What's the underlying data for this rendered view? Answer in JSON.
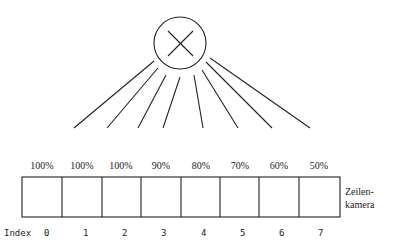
{
  "diagram": {
    "node": {
      "symbol": "multiply"
    },
    "weights": [
      "100%",
      "100%",
      "100%",
      "90%",
      "80%",
      "70%",
      "60%",
      "50%"
    ],
    "camera_label_line1": "Zeilen-",
    "camera_label_line2": "kamera",
    "index_label": "Index",
    "indices": [
      "0",
      "1",
      "2",
      "3",
      "4",
      "5",
      "6",
      "7"
    ]
  }
}
